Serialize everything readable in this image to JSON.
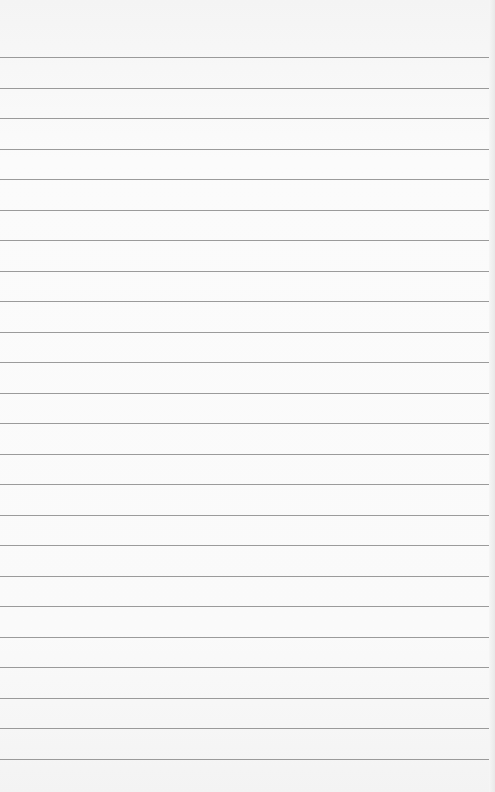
{
  "page": {
    "type": "lined-paper",
    "background_color": "#f8f8f8",
    "rule_color": "#8a8a8a",
    "rule_count": 24,
    "first_rule_y": 57,
    "rule_spacing": 30.5
  }
}
